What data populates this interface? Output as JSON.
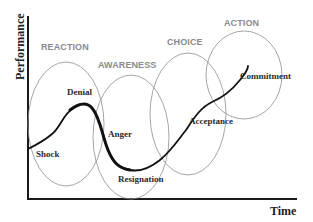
{
  "diagram": {
    "axes": {
      "y_label": "Performance",
      "x_label": "Time"
    },
    "phases": [
      {
        "id": "reaction",
        "label": "REACTION",
        "cx": 66,
        "cy": 124,
        "rx": 38,
        "ry": 62,
        "label_x": 41,
        "label_y": 50
      },
      {
        "id": "awareness",
        "label": "AWARENESS",
        "cx": 131,
        "cy": 137,
        "rx": 38,
        "ry": 62,
        "label_x": 98,
        "label_y": 68
      },
      {
        "id": "choice",
        "label": "CHOICE",
        "cx": 188,
        "cy": 114,
        "rx": 38,
        "ry": 61,
        "label_x": 167,
        "label_y": 45
      },
      {
        "id": "action",
        "label": "ACTION",
        "cx": 244,
        "cy": 75,
        "rx": 38,
        "ry": 44,
        "label_x": 224,
        "label_y": 26
      }
    ],
    "stages": [
      {
        "id": "shock",
        "label": "Shock",
        "x": 36,
        "y": 157
      },
      {
        "id": "denial",
        "label": "Denial",
        "x": 67,
        "y": 95
      },
      {
        "id": "anger",
        "label": "Anger",
        "x": 108,
        "y": 137
      },
      {
        "id": "resignation",
        "label": "Resignation",
        "x": 118,
        "y": 182
      },
      {
        "id": "acceptance",
        "label": "Acceptance",
        "x": 189,
        "y": 124
      },
      {
        "id": "commitment",
        "label": "Commitment",
        "x": 240,
        "y": 79
      }
    ],
    "curve": {
      "path": "M 28 149 C 36 145, 44 141, 52 134 C 60 128, 63 115, 72 109 C 78 104, 86 101, 92 108 C 100 117, 102 135, 108 150 C 113 162, 118 168, 130 170 C 140 172, 150 168, 160 160 C 172 150, 178 140, 186 130 C 194 118, 200 108, 212 102 C 224 97, 232 90, 240 80 C 245 74, 248 68, 248 66",
      "thick_segment": "M 70 110 C 78 104, 86 101, 92 108 C 100 117, 102 135, 108 150 C 113 162, 118 168, 130 170"
    },
    "colors": {
      "curve": "#111111",
      "ellipse": "#8e8e8e",
      "phase_text": "#8a8a8a",
      "stage_text": "#2a2a2a",
      "axis": "#1a1a1a"
    }
  }
}
